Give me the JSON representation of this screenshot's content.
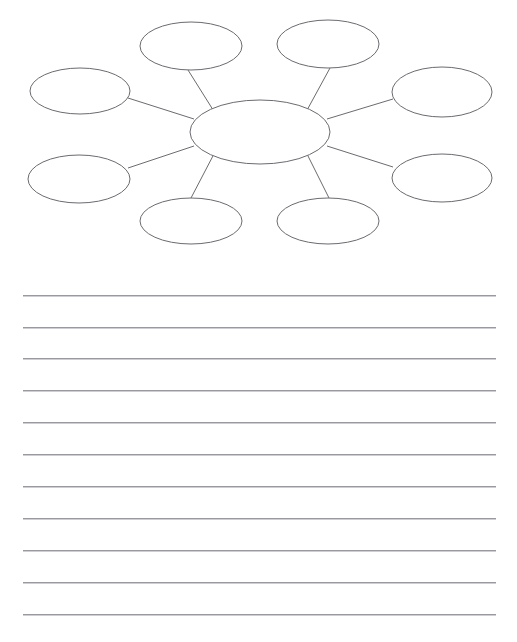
{
  "page": {
    "background_color": "#ffffff",
    "width": 517,
    "height": 642,
    "header_clipped_text": "Name:                Date:"
  },
  "organizer": {
    "name": "spider-web-diagram",
    "type": "web-graphic-organizer",
    "stroke_color": "#6b6b70",
    "fill_color": "#ffffff",
    "stroke_width": 1,
    "center_node": {
      "id": "center",
      "label": "",
      "cx": 260,
      "cy": 132,
      "rx": 70,
      "ry": 32
    },
    "outer_nodes": [
      {
        "id": "node-1",
        "label": "",
        "position": "top-left-inner",
        "cx": 191,
        "cy": 46,
        "rx": 51,
        "ry": 24
      },
      {
        "id": "node-2",
        "label": "",
        "position": "top-right-inner",
        "cx": 328,
        "cy": 44,
        "rx": 51,
        "ry": 24
      },
      {
        "id": "node-3",
        "label": "",
        "position": "left-upper",
        "cx": 80,
        "cy": 91,
        "rx": 50,
        "ry": 23
      },
      {
        "id": "node-4",
        "label": "",
        "position": "right-upper",
        "cx": 442,
        "cy": 92,
        "rx": 50,
        "ry": 25
      },
      {
        "id": "node-5",
        "label": "",
        "position": "left-lower",
        "cx": 79,
        "cy": 179,
        "rx": 51,
        "ry": 24
      },
      {
        "id": "node-6",
        "label": "",
        "position": "right-lower",
        "cx": 442,
        "cy": 178,
        "rx": 50,
        "ry": 24
      },
      {
        "id": "node-7",
        "label": "",
        "position": "bottom-left",
        "cx": 191,
        "cy": 221,
        "rx": 51,
        "ry": 23
      },
      {
        "id": "node-8",
        "label": "",
        "position": "bottom-right",
        "cx": 328,
        "cy": 221,
        "rx": 51,
        "ry": 23
      }
    ],
    "connectors": [
      {
        "id": "spoke-1",
        "from": "center",
        "to": "node-1"
      },
      {
        "id": "spoke-2",
        "from": "center",
        "to": "node-2"
      },
      {
        "id": "spoke-3",
        "from": "center",
        "to": "node-3"
      },
      {
        "id": "spoke-4",
        "from": "center",
        "to": "node-4"
      },
      {
        "id": "spoke-5",
        "from": "center",
        "to": "node-5"
      },
      {
        "id": "spoke-6",
        "from": "center",
        "to": "node-6"
      },
      {
        "id": "spoke-7",
        "from": "center",
        "to": "node-7"
      },
      {
        "id": "spoke-8",
        "from": "center",
        "to": "node-8"
      }
    ]
  },
  "writing_lines": {
    "name": "writing-lines",
    "count": 11,
    "left": 23,
    "right": 496,
    "color": "#9a9a9e",
    "y_positions": [
      295,
      327,
      358,
      390,
      422,
      454,
      486,
      518,
      550,
      582,
      614
    ],
    "values": [
      "",
      "",
      "",
      "",
      "",
      "",
      "",
      "",
      "",
      "",
      ""
    ]
  }
}
